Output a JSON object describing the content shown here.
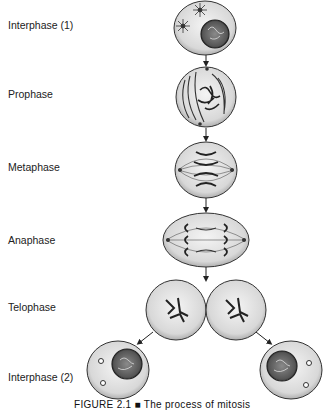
{
  "stages": [
    {
      "id": "interphase-1",
      "label": "Interphase (1)"
    },
    {
      "id": "prophase",
      "label": "Prophase"
    },
    {
      "id": "metaphase",
      "label": "Metaphase"
    },
    {
      "id": "anaphase",
      "label": "Anaphase"
    },
    {
      "id": "telophase",
      "label": "Telophase"
    },
    {
      "id": "interphase-2",
      "label": "Interphase (2)"
    }
  ],
  "caption": "FIGURE 2.1 ■ The process of mitosis",
  "colors": {
    "cell_fill": "#e2e2e2",
    "cell_outline": "#333333",
    "nucleus_fill": "#6a6a6a",
    "chromosome": "#222222",
    "arrow": "#222222"
  }
}
